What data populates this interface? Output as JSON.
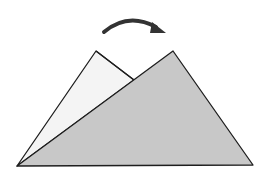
{
  "diagram": {
    "colors": {
      "background": "#ffffff",
      "back_triangle_fill": "#f4f4f4",
      "front_triangle_fill": "#c8c8c8",
      "stroke": "#1e1e1e",
      "arrow": "#333333"
    },
    "back_triangle": {
      "points": "17,166 96,51 134,80"
    },
    "front_triangle": {
      "points": "17,166 173,51 253,165"
    },
    "arrow": {
      "path": "M104,32 Q128,10 158,28",
      "direction": "clockwise"
    }
  }
}
